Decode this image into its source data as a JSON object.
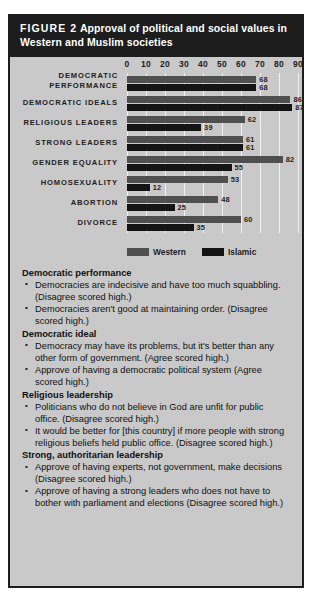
{
  "header": {
    "figure_label": "FIGURE 2",
    "title": "Approval of political and social values in Western and Muslim societies"
  },
  "chart_data": {
    "type": "bar",
    "orientation": "horizontal",
    "title": "Approval of political and social values in Western and Muslim societies",
    "xlabel": "",
    "ylabel": "",
    "xlim": [
      0,
      90
    ],
    "ticks": [
      0,
      10,
      20,
      30,
      40,
      50,
      60,
      70,
      80,
      90
    ],
    "grid": true,
    "legend_position": "bottom",
    "categories": [
      "DEMOCRATIC PERFORMANCE",
      "DEMOCRATIC IDEALS",
      "RELIGIOUS LEADERS",
      "STRONG LEADERS",
      "GENDER EQUALITY",
      "HOMOSEXUALITY",
      "ABORTION",
      "DIVORCE"
    ],
    "category_lines": [
      [
        "DEMOCRATIC",
        "PERFORMANCE"
      ],
      [
        "DEMOCRATIC IDEALS"
      ],
      [
        "RELIGIOUS LEADERS"
      ],
      [
        "STRONG LEADERS"
      ],
      [
        "GENDER EQUALITY"
      ],
      [
        "HOMOSEXUALITY"
      ],
      [
        "ABORTION"
      ],
      [
        "DIVORCE"
      ]
    ],
    "series": [
      {
        "name": "Western",
        "color": "#4f4f4f",
        "values": [
          68,
          86,
          62,
          61,
          82,
          53,
          48,
          60
        ]
      },
      {
        "name": "Islamic",
        "color": "#141414",
        "values": [
          68,
          87,
          39,
          61,
          55,
          12,
          25,
          35
        ]
      }
    ]
  },
  "notes": [
    {
      "heading": "Democratic performance",
      "bullets": [
        "Democracies are indecisive and have too much squabbling. (Disagree scored high.)",
        "Democracies aren't good at maintaining order. (Disagree scored high.)"
      ]
    },
    {
      "heading": "Democratic ideal",
      "bullets": [
        "Democracy may have its problems, but it's better than any other form of government. (Agree scored high.)",
        "Approve of having a democratic political system (Agree scored high.)"
      ]
    },
    {
      "heading": "Religious leadership",
      "bullets": [
        "Politicians who do not believe in God are unfit for public office. (Disagree scored high.)",
        "It would be better for [this country] if more people with strong religious beliefs held public office. (Disagree scored high.)"
      ]
    },
    {
      "heading": "Strong, authoritarian leadership",
      "bullets": [
        "Approve of having experts, not government, make decisions (Disagree scored high.)",
        "Approve of having a strong leaders who does not have to bother with parliament and elections (Disagree scored high.)"
      ]
    }
  ]
}
